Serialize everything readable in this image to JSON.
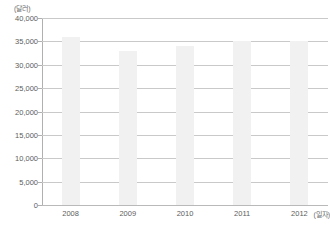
{
  "chart_data": {
    "type": "bar",
    "title": "",
    "subtitle": "",
    "xlabel": "(일자)",
    "ylabel": "(달러)",
    "categories": [
      "2008",
      "2009",
      "2010",
      "2011",
      "2012"
    ],
    "values": [
      36000,
      33000,
      34000,
      35000,
      35000
    ],
    "series": [
      {
        "name": "",
        "values": [
          36000,
          33000,
          34000,
          35000,
          35000
        ]
      }
    ],
    "ylim": [
      0,
      40000
    ],
    "ytick_labels": [
      "0",
      "5,000",
      "10,000",
      "15,000",
      "20,000",
      "25,000",
      "30,000",
      "35,000",
      "40,000"
    ],
    "ytick_values": [
      0,
      5000,
      10000,
      15000,
      20000,
      25000,
      30000,
      35000,
      40000
    ],
    "xtick_labels": [
      "2008",
      "2009",
      "2010",
      "2011",
      "2012"
    ],
    "grid": true,
    "legend": false,
    "legend_position": "none",
    "bar_color": "#f1f1f1",
    "gridline_color": "#c9c9c9",
    "axis_color": "#b0b0b0",
    "text_color": "#5d5d5d",
    "background_color": "#ffffff"
  },
  "axes": {
    "y_unit_caption": "(달러)",
    "x_unit_caption": "(일자)"
  }
}
